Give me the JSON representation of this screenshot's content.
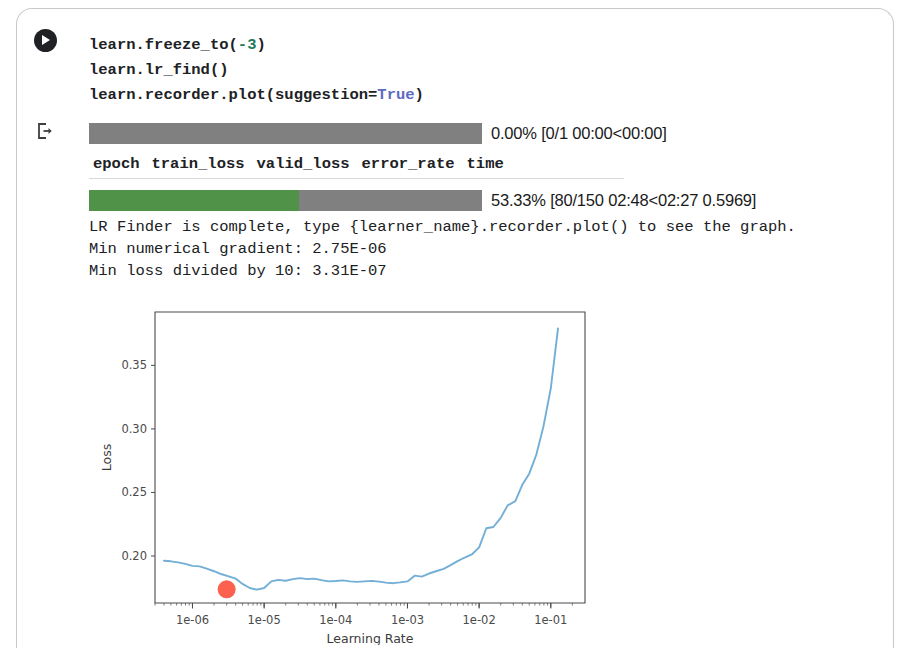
{
  "cell": {
    "run_button_title": "Run cell",
    "output_marker_title": "Cell output"
  },
  "source": {
    "line1_a": "learn.freeze_to(",
    "line1_num": "-3",
    "line1_b": ")",
    "line2": "learn.lr_find()",
    "line3_a": "learn.recorder.plot(suggestion=",
    "line3_kw": "True",
    "line3_b": ")"
  },
  "output": {
    "epoch_progress": {
      "label": "0.00% [0/1 00:00<00:00]",
      "percent": 0.0
    },
    "batch_progress": {
      "label": "53.33% [80/150 02:48<02:27 0.5969]",
      "percent": 53.33
    },
    "table_headers": [
      "epoch",
      "train_loss",
      "valid_loss",
      "error_rate",
      "time"
    ],
    "table_rows": [],
    "log_lines": [
      "LR Finder is complete, type {learner_name}.recorder.plot() to see the graph.",
      "Min numerical gradient: 2.75E-06",
      "Min loss divided by 10: 3.31E-07"
    ]
  },
  "chart_data": {
    "type": "line",
    "title": "",
    "xlabel": "Learning Rate",
    "ylabel": "Loss",
    "xscale": "log",
    "xlim": [
      3e-07,
      0.3
    ],
    "ylim": [
      0.163,
      0.392
    ],
    "xticks": [
      "1e-06",
      "1e-05",
      "1e-04",
      "1e-03",
      "1e-02",
      "1e-01"
    ],
    "xtick_values": [
      1e-06,
      1e-05,
      0.0001,
      0.001,
      0.01,
      0.1
    ],
    "yticks": [
      "0.20",
      "0.25",
      "0.30",
      "0.35"
    ],
    "ytick_values": [
      0.2,
      0.25,
      0.3,
      0.35
    ],
    "grid": false,
    "legend": null,
    "series": [
      {
        "name": "loss",
        "color": "#72aed6",
        "x": [
          4e-07,
          5e-07,
          6.3e-07,
          7.9e-07,
          1e-06,
          1.26e-06,
          1.58e-06,
          2e-06,
          2.5e-06,
          3.2e-06,
          4e-06,
          5e-06,
          6.3e-06,
          7.9e-06,
          1e-05,
          1.26e-05,
          1.58e-05,
          2e-05,
          2.5e-05,
          3.2e-05,
          4e-05,
          5e-05,
          6.3e-05,
          7.9e-05,
          0.0001,
          0.000126,
          0.000158,
          0.0002,
          0.00025,
          0.00032,
          0.0004,
          0.0005,
          0.00063,
          0.00079,
          0.001,
          0.00126,
          0.00158,
          0.002,
          0.0025,
          0.0032,
          0.004,
          0.005,
          0.0063,
          0.0079,
          0.01,
          0.0126,
          0.0158,
          0.02,
          0.025,
          0.032,
          0.04,
          0.05,
          0.063,
          0.079,
          0.1,
          0.126
        ],
        "y": [
          0.1963,
          0.1958,
          0.195,
          0.1938,
          0.1922,
          0.1918,
          0.19,
          0.188,
          0.1858,
          0.184,
          0.1822,
          0.178,
          0.1748,
          0.1735,
          0.1748,
          0.18,
          0.1812,
          0.1805,
          0.1818,
          0.1826,
          0.1818,
          0.1822,
          0.181,
          0.18,
          0.1803,
          0.1808,
          0.18,
          0.1796,
          0.18,
          0.1804,
          0.1798,
          0.179,
          0.1786,
          0.1792,
          0.18,
          0.1845,
          0.1838,
          0.1862,
          0.188,
          0.1898,
          0.1928,
          0.196,
          0.1988,
          0.2012,
          0.2068,
          0.2218,
          0.2228,
          0.23,
          0.2398,
          0.2432,
          0.256,
          0.2648,
          0.28,
          0.302,
          0.332,
          0.379
        ]
      }
    ],
    "markers": [
      {
        "name": "suggested-lr",
        "x": 3e-06,
        "y": 0.1738,
        "color": "#fc604f",
        "radius": 9
      }
    ]
  }
}
